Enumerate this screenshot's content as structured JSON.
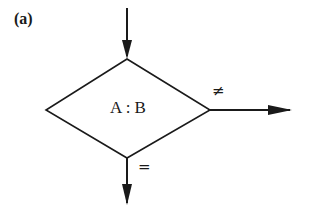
{
  "figure": {
    "panel_label": "(a)",
    "decision": {
      "shape": "diamond",
      "text": "A : B"
    },
    "branches": {
      "not_equal_label": "≠",
      "equal_label": "="
    },
    "colors": {
      "stroke": "#1a1a1a",
      "background": "#ffffff"
    }
  }
}
